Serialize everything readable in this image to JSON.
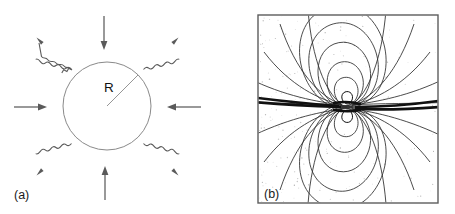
{
  "figure": {
    "background_color": "#ffffff",
    "panels": [
      {
        "id": "a",
        "label": "(a)",
        "caption_position": "bottom-left",
        "description": "sphere of radius R with inward straight arrows and outward wavy arrows",
        "sphere": {
          "radius_label": "R",
          "center_x": 107,
          "center_y": 106,
          "radius_px": 44,
          "stroke_color": "#8a8a8a"
        },
        "straight_arrows": {
          "count": 4,
          "direction": "inward",
          "color": "#6e6e6e",
          "bearings_deg": [
            0,
            90,
            180,
            270
          ]
        },
        "wavy_arrows": {
          "count": 4,
          "direction": "outward",
          "color": "#5a5a5a",
          "bearings_deg": [
            45,
            135,
            225,
            315
          ]
        }
      },
      {
        "id": "b",
        "label": "(b)",
        "caption_position": "inside-bottom-left",
        "description": "magnetic dipole field lines with stippled shading inside a square frame",
        "frame": {
          "x": 30,
          "y": 15,
          "width": 180,
          "height": 188,
          "stroke_color": "#5d5d5d",
          "fill_color": "#ffffff"
        },
        "dipole": {
          "center_x": 119,
          "center_y": 107,
          "axis": "vertical",
          "equatorial_sheet_color": "#111111",
          "fieldline_color": "#2c2c2c",
          "fieldline_count": 26
        },
        "stipple": {
          "color": "#9a9a9a",
          "dot_count": 900
        }
      }
    ]
  },
  "chart_data": {
    "type": "diagram",
    "title": "",
    "panels": [
      {
        "key": "a",
        "label": "(a)",
        "kind": "schematic",
        "annotations": [
          "R"
        ],
        "elements": [
          {
            "name": "sphere",
            "shape": "circle",
            "cx": 107,
            "cy": 106,
            "r": 44
          },
          {
            "name": "radius-indicator",
            "shape": "line",
            "x1": 107,
            "y1": 106,
            "x2": 138,
            "y2": 75,
            "label": "R"
          },
          {
            "name": "inflow-arrow-top",
            "from": [
              104,
              16
            ],
            "to": [
              104,
              48
            ],
            "style": "straight",
            "direction": "down"
          },
          {
            "name": "inflow-arrow-bottom",
            "from": [
              105,
              200
            ],
            "to": [
              105,
              166
            ],
            "style": "straight",
            "direction": "up"
          },
          {
            "name": "inflow-arrow-left",
            "from": [
              14,
              107
            ],
            "to": [
              46,
              107
            ],
            "style": "straight",
            "direction": "right"
          },
          {
            "name": "inflow-arrow-right",
            "from": [
              201,
              107
            ],
            "to": [
              167,
              107
            ],
            "style": "straight",
            "direction": "left"
          },
          {
            "name": "outflow-wavy-top-left",
            "from": [
              72,
              70
            ],
            "to": [
              38,
              38
            ],
            "style": "wavy",
            "direction": "up-left"
          },
          {
            "name": "outflow-wavy-top-right",
            "from": [
              143,
              70
            ],
            "to": [
              176,
              38
            ],
            "style": "wavy",
            "direction": "up-right"
          },
          {
            "name": "outflow-wavy-bottom-left",
            "from": [
              72,
              143
            ],
            "to": [
              38,
              176
            ],
            "style": "wavy",
            "direction": "down-left"
          },
          {
            "name": "outflow-wavy-bottom-right",
            "from": [
              143,
              143
            ],
            "to": [
              176,
              176
            ],
            "style": "wavy",
            "direction": "down-right"
          }
        ]
      },
      {
        "key": "b",
        "label": "(b)",
        "kind": "field-line-map",
        "field": "magnetic dipole",
        "frame_bounds": {
          "x0": 258,
          "y0": 15,
          "x1": 438,
          "y1": 203
        },
        "dipole_center": [
          347,
          107
        ],
        "features": [
          "closed loops above and below the dipole axis",
          "thick dark equatorial current sheet extending left and right",
          "open field lines fanning to the frame corners",
          "grey stippled shading in background"
        ]
      }
    ]
  }
}
